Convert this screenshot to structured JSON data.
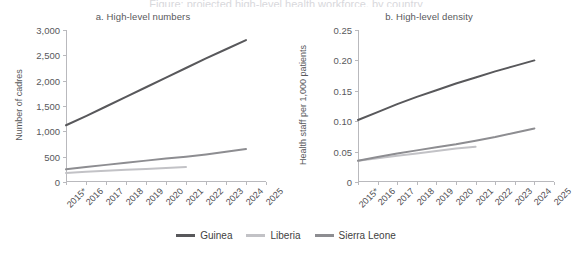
{
  "cut_title": "Figure: projected high-level health workforce, by country",
  "legend": {
    "items": [
      {
        "label": "Guinea",
        "color": "#58585b"
      },
      {
        "label": "Liberia",
        "color": "#c2c2c6"
      },
      {
        "label": "Sierra Leone",
        "color": "#8d8d91"
      }
    ]
  },
  "chart_data": [
    {
      "type": "line",
      "panel": "a",
      "title": "a. High-level numbers",
      "xlabel": "",
      "ylabel": "Number of cadres",
      "x": [
        "2015*",
        "2016",
        "2017",
        "2018",
        "2019",
        "2020",
        "2021",
        "2022",
        "2023",
        "2024",
        "2025"
      ],
      "xlim": [
        2015,
        2025
      ],
      "ylim": [
        0,
        3000
      ],
      "yticks": [
        "0",
        "500",
        "1,000",
        "1,500",
        "2,000",
        "2,500",
        "3,000"
      ],
      "ytick_values": [
        0,
        500,
        1000,
        1500,
        2000,
        2500,
        3000
      ],
      "grid": false,
      "legend_position": "bottom",
      "series": [
        {
          "name": "Guinea",
          "color": "#58585b",
          "x": [
            2015,
            2016,
            2017,
            2018,
            2019,
            2020,
            2021,
            2022,
            2023,
            2024
          ],
          "values": [
            1120,
            1300,
            1490,
            1680,
            1870,
            2060,
            2250,
            2440,
            2620,
            2800
          ]
        },
        {
          "name": "Liberia",
          "color": "#c2c2c6",
          "x": [
            2015,
            2016,
            2017,
            2018,
            2019,
            2020,
            2021
          ],
          "values": [
            180,
            200,
            220,
            240,
            258,
            276,
            295
          ]
        },
        {
          "name": "Sierra Leone",
          "color": "#8d8d91",
          "x": [
            2015,
            2016,
            2017,
            2018,
            2019,
            2020,
            2021,
            2022,
            2023,
            2024
          ],
          "values": [
            250,
            295,
            338,
            380,
            422,
            462,
            500,
            545,
            595,
            650
          ]
        }
      ]
    },
    {
      "type": "line",
      "panel": "b",
      "title": "b. High-level density",
      "xlabel": "",
      "ylabel": "Health staff per 1,000 patients",
      "x": [
        "2015*",
        "2016",
        "2017",
        "2018",
        "2019",
        "2020",
        "2021",
        "2022",
        "2023",
        "2024",
        "2025"
      ],
      "xlim": [
        2015,
        2025
      ],
      "ylim": [
        0,
        0.25
      ],
      "yticks": [
        "0",
        "0.05",
        "0.10",
        "0.15",
        "0.20",
        "0.25"
      ],
      "ytick_values": [
        0,
        0.05,
        0.1,
        0.15,
        0.2,
        0.25
      ],
      "grid": false,
      "legend_position": "bottom",
      "series": [
        {
          "name": "Guinea",
          "color": "#58585b",
          "x": [
            2015,
            2016,
            2017,
            2018,
            2019,
            2020,
            2021,
            2022,
            2023,
            2024
          ],
          "values": [
            0.102,
            0.115,
            0.128,
            0.14,
            0.151,
            0.162,
            0.172,
            0.182,
            0.191,
            0.2
          ]
        },
        {
          "name": "Liberia",
          "color": "#c2c2c6",
          "x": [
            2015,
            2016,
            2017,
            2018,
            2019,
            2020,
            2021
          ],
          "values": [
            0.035,
            0.039,
            0.043,
            0.047,
            0.051,
            0.055,
            0.058
          ]
        },
        {
          "name": "Sierra Leone",
          "color": "#8d8d91",
          "x": [
            2015,
            2016,
            2017,
            2018,
            2019,
            2020,
            2021,
            2022,
            2023,
            2024
          ],
          "values": [
            0.035,
            0.041,
            0.047,
            0.052,
            0.057,
            0.062,
            0.068,
            0.074,
            0.081,
            0.088
          ]
        }
      ]
    }
  ]
}
